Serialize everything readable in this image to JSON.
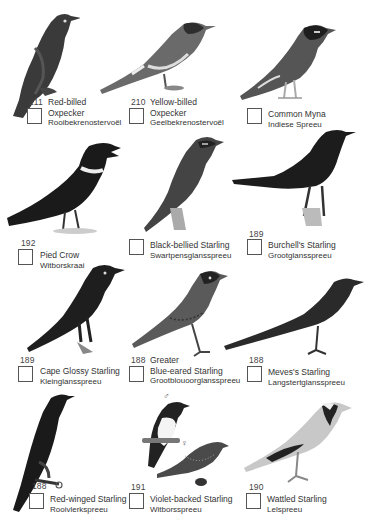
{
  "page": {
    "type": "bird checklist field guide page",
    "entries": [
      {
        "number": "211",
        "name_line1": "Red-billed",
        "name_line2": "Oxpecker",
        "afrikaans": "Rooibekrenostervoël"
      },
      {
        "number": "210",
        "name_line1": "Yellow-billed",
        "name_line2": "Oxpecker",
        "afrikaans": "Geelbekrenostervoël"
      },
      {
        "number": "",
        "name_line1": "",
        "name_line2": "Common Myna",
        "afrikaans": "Indiese Spreeu"
      },
      {
        "number": "192",
        "name_line1": "",
        "name_line2": "Pied Crow",
        "afrikaans": "Witborskraai"
      },
      {
        "number": "",
        "name_line1": "",
        "name_line2": "Black-bellied Starling",
        "afrikaans": "Swartpensglansspreeu"
      },
      {
        "number": "189",
        "name_line1": "",
        "name_line2": "Burchell's Starling",
        "afrikaans": "Grootglansspreeu"
      },
      {
        "number": "189",
        "name_line1": "",
        "name_line2": "Cape Glossy Starling",
        "afrikaans": "Kleinglansspreeu"
      },
      {
        "number": "188",
        "name_line1": "Greater",
        "name_line2": "Blue-eared Starling",
        "afrikaans": "Grootblouoorglansspreeu"
      },
      {
        "number": "188",
        "name_line1": "",
        "name_line2": "Meves's Starling",
        "afrikaans": "Langstertglansspreeu"
      },
      {
        "number": "188",
        "name_line1": "",
        "name_line2": "Red-winged Starling",
        "afrikaans": "Rooivlerkspreeu"
      },
      {
        "number": "191",
        "name_line1": "",
        "name_line2": "Violet-backed Starling",
        "afrikaans": "Witborsspreeu"
      },
      {
        "number": "190",
        "name_line1": "",
        "name_line2": "Wattled Starling",
        "afrikaans": "Lelspreeu"
      }
    ],
    "symbols": {
      "male": "♂",
      "female": "♀"
    }
  }
}
